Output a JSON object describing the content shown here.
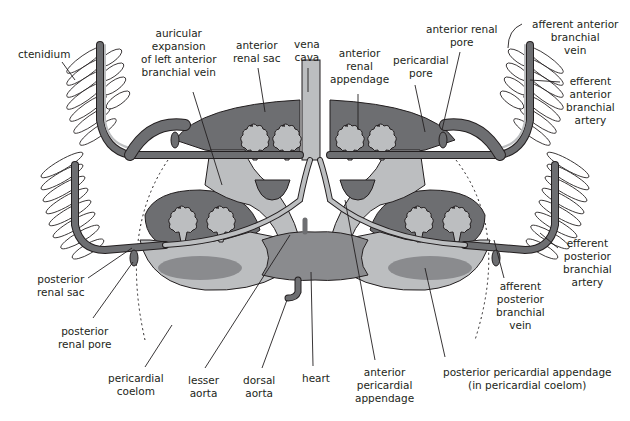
{
  "diagram": {
    "colors": {
      "dark_gray": "#6d6e71",
      "mid_gray": "#8a8b8e",
      "light_gray": "#bcbec0",
      "outline": "#231f20",
      "background": "#ffffff"
    },
    "labels": {
      "ctenidium": "ctenidium",
      "auricular_expansion": "auricular\nexpansion\nof left anterior\nbranchial vein",
      "anterior_renal_sac": "anterior\nrenal sac",
      "vena_cava": "vena\ncava",
      "anterior_renal_appendage": "anterior\nrenal\nappendage",
      "pericardial_pore": "pericardial\npore",
      "anterior_renal_pore": "anterior renal\npore",
      "afferent_anterior_branchial_vein": "afferent anterior\nbranchial\nvein",
      "efferent_anterior_branchial_artery": "efferent\nanterior\nbranchial\nartery",
      "efferent_posterior_branchial_artery": "efferent\nposterior\nbranchial\nartery",
      "afferent_posterior_branchial_vein": "afferent\nposterior\nbranchial\nvein",
      "posterior_renal_sac": "posterior\nrenal sac",
      "posterior_renal_pore": "posterior\nrenal pore",
      "pericardial_coelom": "pericardial\ncoelom",
      "lesser_aorta": "lesser\naorta",
      "dorsal_aorta": "dorsal\naorta",
      "heart": "heart",
      "anterior_pericardial_appendage": "anterior\npericardial\nappendage",
      "posterior_pericardial_appendage": "posterior pericardial appendage\n(in pericardial coelom)"
    }
  }
}
